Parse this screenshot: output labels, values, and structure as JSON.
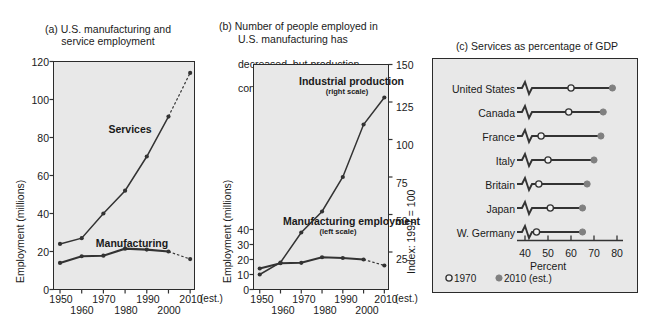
{
  "figure": {
    "background": "#ffffff",
    "plot_background": "#e8e8e8",
    "line_color": "#333333",
    "marker_2010_color": "#808080"
  },
  "panel_a": {
    "title": "(a) U.S. manufacturing and\nservice employment",
    "est_note": "(est.)",
    "chart_data": {
      "type": "line",
      "title": "(a) U.S. manufacturing and service employment",
      "xlabel": "",
      "ylabel": "Employment (millions)",
      "xlim": [
        1945,
        2012
      ],
      "ylim": [
        0,
        120
      ],
      "grid": false,
      "legend": "inline-annotation",
      "x": [
        1950,
        1960,
        1970,
        1980,
        1990,
        2000,
        2010
      ],
      "xtick_labels": [
        "1950",
        "1960",
        "1970",
        "1980",
        "1990",
        "2000",
        "2010"
      ],
      "ytick_labels": [
        "0",
        "20",
        "40",
        "60",
        "80",
        "100",
        "120"
      ],
      "series": [
        {
          "name": "Services",
          "values": [
            24,
            27,
            40,
            52,
            70,
            91,
            114
          ],
          "last_segment_dashed": true
        },
        {
          "name": "Manufacturing",
          "values": [
            14,
            17.5,
            17.8,
            21.5,
            21,
            20,
            16
          ],
          "last_segment_dashed": true
        }
      ]
    }
  },
  "panel_b": {
    "title_lines": [
      "(b) Number of people employed in",
      "U.S. manufacturing has",
      "decreased, but production",
      "continues to increase."
    ],
    "est_note": "(est.)",
    "chart_data": {
      "type": "line",
      "title": "(b) Number of people employed in U.S. manufacturing has decreased, but production continues to increase.",
      "xlabel": "",
      "ylabel": "Employment (millions)",
      "ylabel_right": "Index: 1997 = 100",
      "xlim": [
        1945,
        2012
      ],
      "ylim_left": [
        0,
        150
      ],
      "ylim_right": [
        0,
        150
      ],
      "grid": false,
      "x": [
        1950,
        1960,
        1970,
        1980,
        1990,
        2000,
        2010
      ],
      "xtick_labels": [
        "1950",
        "1960",
        "1970",
        "1980",
        "1990",
        "2000",
        "2010"
      ],
      "ytick_labels_left": [
        "0",
        "10",
        "20",
        "30",
        "40"
      ],
      "ytick_labels_right": [
        "25",
        "50",
        "75",
        "100",
        "125",
        "150"
      ],
      "series": [
        {
          "name": "Manufacturing employment",
          "scale": "left scale",
          "values": [
            14,
            17.5,
            17.8,
            21.5,
            21,
            20,
            16
          ],
          "last_segment_dashed": true
        },
        {
          "name": "Industrial production",
          "scale": "right scale",
          "values": [
            10,
            18,
            38,
            52,
            75,
            110,
            128
          ],
          "last_segment_dashed": false
        }
      ]
    }
  },
  "panel_c": {
    "title": "(c) Services as percentage of GDP",
    "axis_label": "Percent",
    "legend": [
      {
        "marker": "open-circle",
        "label": "1970"
      },
      {
        "marker": "filled-circle",
        "label": "2010 (est.)"
      }
    ],
    "chart_data": {
      "type": "scatter",
      "subtype": "dumbbell",
      "title": "(c) Services as percentage of GDP",
      "xlabel": "Percent",
      "ylabel": "",
      "xlim": [
        38,
        80
      ],
      "axis_break": true,
      "grid": false,
      "xtick_labels": [
        "40",
        "50",
        "60",
        "70",
        "80"
      ],
      "xticks": [
        40,
        50,
        60,
        70,
        80
      ],
      "categories": [
        "United States",
        "Canada",
        "France",
        "Italy",
        "Britain",
        "Japan",
        "W. Germany"
      ],
      "series": [
        {
          "name": "1970",
          "values": [
            60,
            59,
            47,
            50,
            46,
            51,
            45
          ]
        },
        {
          "name": "2010 (est.)",
          "values": [
            78,
            74,
            73,
            70,
            67,
            65,
            65
          ]
        }
      ]
    }
  }
}
